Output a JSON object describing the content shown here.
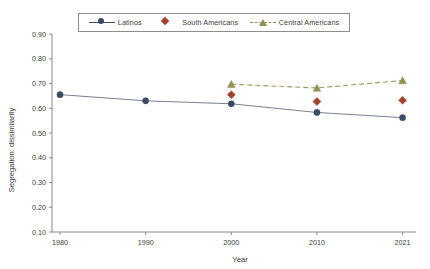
{
  "chart_data": {
    "type": "line",
    "title": "",
    "xlabel": "Year",
    "ylabel": "Segregation: dissimilarity",
    "x": [
      1980,
      1990,
      2000,
      2010,
      2021
    ],
    "xtick_labels": [
      "1980",
      "1990",
      "2000",
      "2010",
      "2021"
    ],
    "ytick_labels": [
      "0.10",
      "0.20",
      "0.30",
      "0.40",
      "0.50",
      "0.60",
      "0.70",
      "0.80",
      "0.90"
    ],
    "ytick_values": [
      0.1,
      0.2,
      0.3,
      0.4,
      0.5,
      0.6,
      0.7,
      0.8,
      0.9
    ],
    "ylim": [
      0.1,
      0.9
    ],
    "grid": false,
    "legend_position": "top-center",
    "series": [
      {
        "name": "Latinos",
        "color": "#3b4a63",
        "line_color": "#6b7280",
        "marker": "circle",
        "line_style": "solid",
        "x": [
          1980,
          1990,
          2000,
          2010,
          2021
        ],
        "values": [
          0.655,
          0.63,
          0.618,
          0.583,
          0.562
        ]
      },
      {
        "name": "South Americans",
        "color": "#a0432a",
        "line_color": "#a0432a",
        "marker": "diamond",
        "line_style": "none",
        "x": [
          2000,
          2010,
          2021
        ],
        "values": [
          0.655,
          0.627,
          0.632
        ]
      },
      {
        "name": "Central Americans",
        "color": "#8f9052",
        "line_color": "#9a9a60",
        "marker": "triangle",
        "line_style": "dashed",
        "x": [
          2000,
          2010,
          2021
        ],
        "values": [
          0.697,
          0.682,
          0.712
        ]
      }
    ]
  },
  "legend": {
    "items": [
      {
        "label": "Latinos",
        "marker": "circle-marker-icon"
      },
      {
        "label": "South Americans",
        "marker": "diamond-marker-icon"
      },
      {
        "label": "Central Americans",
        "marker": "triangle-marker-icon"
      }
    ]
  },
  "axes": {
    "x_title": "Year",
    "y_title": "Segregation: dissimilarity"
  }
}
